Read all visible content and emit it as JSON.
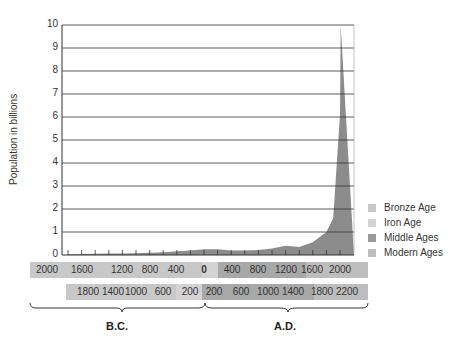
{
  "chart_data": {
    "type": "area",
    "title": "",
    "ylabel": "Population in billions",
    "xlabel": "",
    "ylim": [
      0,
      10
    ],
    "y_ticks": [
      "0",
      "1",
      "2",
      "3",
      "4",
      "5",
      "6",
      "7",
      "8",
      "9",
      "10"
    ],
    "grid": true,
    "x": [
      -2000,
      -1800,
      -1600,
      -1400,
      -1200,
      -1000,
      -800,
      -600,
      -400,
      -200,
      0,
      200,
      400,
      600,
      800,
      1000,
      1200,
      1400,
      1600,
      1800,
      1900,
      2000,
      2010
    ],
    "values": [
      0.03,
      0.04,
      0.05,
      0.06,
      0.07,
      0.08,
      0.1,
      0.12,
      0.16,
      0.2,
      0.25,
      0.25,
      0.2,
      0.2,
      0.22,
      0.28,
      0.4,
      0.35,
      0.55,
      1.0,
      1.6,
      6.1,
      10.0
    ],
    "x_tick_rows": [
      {
        "labels": [
          "2000",
          "1600",
          "1200",
          "800",
          "400",
          "0",
          "400",
          "800",
          "1200",
          "1600",
          "2000"
        ]
      },
      {
        "labels": [
          "1800",
          "1400",
          "1000",
          "600",
          "200",
          "200",
          "600",
          "1000",
          "1400",
          "1800",
          "2200"
        ]
      }
    ],
    "eras": [
      "B.C.",
      "A.D."
    ],
    "legend": {
      "position": "right",
      "entries": [
        {
          "label": "Bronze Age",
          "color": "#c8c8c8"
        },
        {
          "label": "Iron Age",
          "color": "#d3d3d3"
        },
        {
          "label": "Middle Ages",
          "color": "#9a9a9a"
        },
        {
          "label": "Modern Ages",
          "color": "#bdbdbd"
        }
      ]
    }
  },
  "axis": {
    "ylabel": "Population in billions"
  },
  "eras": {
    "bc": "B.C.",
    "ad": "A.D."
  },
  "colors": {
    "area_fill": "#8c8c8c",
    "grid": "#333333",
    "band_bronze": "#c8c8c8",
    "band_iron": "#d3d3d3",
    "band_middle": "#a8a8a8",
    "band_modern": "#bdbdbd"
  }
}
